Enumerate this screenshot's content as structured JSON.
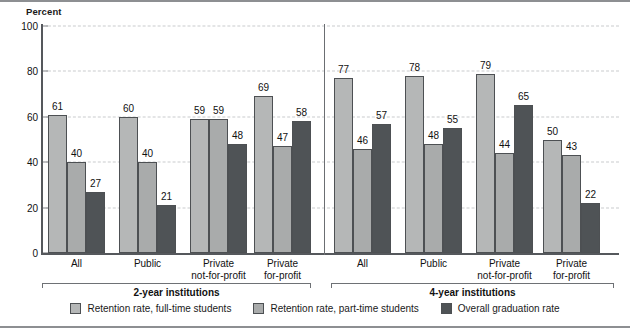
{
  "chart_data": {
    "type": "bar",
    "title": "",
    "ylabel": "Percent",
    "xlabel": "",
    "ylim": [
      0,
      100
    ],
    "yticks": [
      0,
      20,
      40,
      60,
      80,
      100
    ],
    "grid": true,
    "legend_position": "bottom",
    "series": [
      {
        "name": "Retention rate, full-time students",
        "color": "#b5b7b7"
      },
      {
        "name": "Retention rate, part-time students",
        "color": "#a9abab"
      },
      {
        "name": "Overall graduation rate",
        "color": "#4f5356"
      }
    ],
    "panels": [
      {
        "title": "2-year institutions",
        "categories": [
          "All",
          "Public",
          "Private\nnot-for-profit",
          "Private\nfor-profit"
        ],
        "groups": [
          {
            "label_line1": "All",
            "label_line2": "",
            "values": [
              61,
              40,
              27
            ]
          },
          {
            "label_line1": "Public",
            "label_line2": "",
            "values": [
              60,
              40,
              21
            ]
          },
          {
            "label_line1": "Private",
            "label_line2": "not-for-profit",
            "values": [
              59,
              59,
              48
            ]
          },
          {
            "label_line1": "Private",
            "label_line2": "for-profit",
            "values": [
              69,
              47,
              58
            ]
          }
        ]
      },
      {
        "title": "4-year institutions",
        "categories": [
          "All",
          "Public",
          "Private\nnot-for-profit",
          "Private\nfor-profit"
        ],
        "groups": [
          {
            "label_line1": "All",
            "label_line2": "",
            "values": [
              77,
              46,
              57
            ]
          },
          {
            "label_line1": "Public",
            "label_line2": "",
            "values": [
              78,
              48,
              55
            ]
          },
          {
            "label_line1": "Private",
            "label_line2": "not-for-profit",
            "values": [
              79,
              44,
              65
            ]
          },
          {
            "label_line1": "Private",
            "label_line2": "for-profit",
            "values": [
              50,
              43,
              22
            ]
          }
        ]
      }
    ]
  },
  "axis": {
    "y_title": "Percent",
    "ticks": [
      "0",
      "20",
      "40",
      "60",
      "80",
      "100"
    ]
  },
  "legend": {
    "items": [
      {
        "label": "Retention rate, full-time students",
        "swatch": "s0"
      },
      {
        "label": "Retention rate, part-time students",
        "swatch": "s1"
      },
      {
        "label": "Overall graduation rate",
        "swatch": "s2"
      }
    ]
  },
  "colors": {
    "series_full_time": "#b5b7b7",
    "series_part_time": "#a9abab",
    "series_graduation": "#4f5356",
    "axis": "#55585c",
    "grid": "#c9cbcd"
  }
}
